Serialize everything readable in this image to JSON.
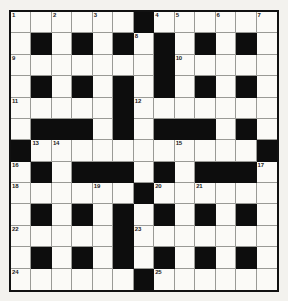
{
  "puzzle": {
    "kind": "crossword-grid",
    "rows": 13,
    "cols": 13,
    "colors": {
      "page_background": "#f3f2ee",
      "cell_fill": "#fbfaf7",
      "block_fill": "#0d0d0d",
      "grid_line": "#9a9a96",
      "frame": "#111111",
      "number_text": "#1b1b1b"
    },
    "blocks": [
      [
        0,
        6
      ],
      [
        1,
        1
      ],
      [
        1,
        3
      ],
      [
        1,
        5
      ],
      [
        1,
        7
      ],
      [
        1,
        9
      ],
      [
        1,
        11
      ],
      [
        2,
        7
      ],
      [
        3,
        1
      ],
      [
        3,
        3
      ],
      [
        3,
        5
      ],
      [
        3,
        7
      ],
      [
        3,
        9
      ],
      [
        3,
        11
      ],
      [
        4,
        5
      ],
      [
        5,
        1
      ],
      [
        5,
        2
      ],
      [
        5,
        3
      ],
      [
        5,
        5
      ],
      [
        5,
        7
      ],
      [
        5,
        8
      ],
      [
        5,
        9
      ],
      [
        5,
        11
      ],
      [
        6,
        0
      ],
      [
        6,
        12
      ],
      [
        7,
        1
      ],
      [
        7,
        3
      ],
      [
        7,
        4
      ],
      [
        7,
        5
      ],
      [
        7,
        7
      ],
      [
        7,
        9
      ],
      [
        7,
        10
      ],
      [
        7,
        11
      ],
      [
        8,
        6
      ],
      [
        9,
        1
      ],
      [
        9,
        3
      ],
      [
        9,
        5
      ],
      [
        9,
        7
      ],
      [
        9,
        9
      ],
      [
        9,
        11
      ],
      [
        10,
        5
      ],
      [
        11,
        1
      ],
      [
        11,
        3
      ],
      [
        11,
        5
      ],
      [
        11,
        7
      ],
      [
        11,
        9
      ],
      [
        11,
        11
      ],
      [
        12,
        6
      ]
    ],
    "numbers": [
      {
        "n": "1",
        "row": 0,
        "col": 0
      },
      {
        "n": "2",
        "row": 0,
        "col": 2
      },
      {
        "n": "3",
        "row": 0,
        "col": 4
      },
      {
        "n": "4",
        "row": 0,
        "col": 7
      },
      {
        "n": "5",
        "row": 0,
        "col": 8
      },
      {
        "n": "6",
        "row": 0,
        "col": 10
      },
      {
        "n": "7",
        "row": 0,
        "col": 12
      },
      {
        "n": "8",
        "row": 1,
        "col": 6
      },
      {
        "n": "9",
        "row": 2,
        "col": 0
      },
      {
        "n": "10",
        "row": 2,
        "col": 8
      },
      {
        "n": "11",
        "row": 4,
        "col": 0
      },
      {
        "n": "12",
        "row": 4,
        "col": 6
      },
      {
        "n": "13",
        "row": 6,
        "col": 1
      },
      {
        "n": "14",
        "row": 6,
        "col": 2
      },
      {
        "n": "15",
        "row": 6,
        "col": 8
      },
      {
        "n": "16",
        "row": 7,
        "col": 0
      },
      {
        "n": "17",
        "row": 7,
        "col": 12
      },
      {
        "n": "18",
        "row": 8,
        "col": 0
      },
      {
        "n": "19",
        "row": 8,
        "col": 4
      },
      {
        "n": "20",
        "row": 8,
        "col": 7
      },
      {
        "n": "21",
        "row": 8,
        "col": 9
      },
      {
        "n": "22",
        "row": 10,
        "col": 0
      },
      {
        "n": "23",
        "row": 10,
        "col": 6
      },
      {
        "n": "24",
        "row": 12,
        "col": 0
      },
      {
        "n": "25",
        "row": 12,
        "col": 7
      }
    ],
    "entries": []
  }
}
